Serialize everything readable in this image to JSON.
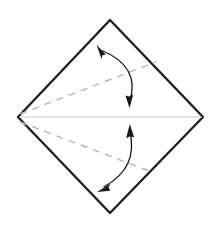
{
  "figure": {
    "title": "Origami fold step diagram",
    "background_color": "#ffffff"
  },
  "colors": {
    "paper_outline": "#231f20",
    "paper_fill": "#ffffff",
    "crease_dashed": "#b3b3b3",
    "center_line": "#cccccc",
    "arrow": "#1a1a1a"
  },
  "geometry": {
    "canvas": {
      "width": 221,
      "height": 229
    },
    "paper_shape": "diamond",
    "vertices": {
      "top": {
        "x": 110,
        "y": 20
      },
      "right": {
        "x": 203,
        "y": 117
      },
      "bottom": {
        "x": 110,
        "y": 213
      },
      "left": {
        "x": 18,
        "y": 117
      }
    },
    "outline_stroke_width": 2.4
  },
  "creases": [
    {
      "name": "upper-crease",
      "type": "dashed",
      "from": {
        "x": 20,
        "y": 114
      },
      "to": {
        "x": 156,
        "y": 62
      },
      "dash_pattern": "7 6",
      "stroke_width": 1.4
    },
    {
      "name": "lower-crease",
      "type": "dashed",
      "from": {
        "x": 20,
        "y": 122
      },
      "to": {
        "x": 152,
        "y": 172
      },
      "dash_pattern": "7 6",
      "stroke_width": 1.4
    }
  ],
  "center_line": {
    "name": "horizontal-center-line",
    "type": "solid-faint",
    "from": {
      "x": 19,
      "y": 117
    },
    "to": {
      "x": 202,
      "y": 117
    },
    "stroke_width": 1.2
  },
  "arrows": [
    {
      "name": "upper-fold-arrow",
      "kind": "curved-double-headed",
      "meaning": "fold upper flap down to center",
      "start": {
        "x": 99,
        "y": 48
      },
      "control": {
        "x": 141,
        "y": 66
      },
      "end": {
        "x": 130,
        "y": 105
      },
      "stroke_width": 1.3,
      "heads": [
        {
          "position": "start",
          "x": 99,
          "y": 48,
          "angle_deg": 248
        },
        {
          "position": "end",
          "x": 130,
          "y": 105,
          "angle_deg": 76
        }
      ]
    },
    {
      "name": "lower-fold-arrow",
      "kind": "curved-double-headed",
      "meaning": "fold lower flap up to center",
      "start": {
        "x": 130,
        "y": 127
      },
      "control": {
        "x": 138,
        "y": 166
      },
      "end": {
        "x": 101,
        "y": 190
      },
      "stroke_width": 1.3,
      "heads": [
        {
          "position": "start",
          "x": 130,
          "y": 127,
          "angle_deg": 282
        },
        {
          "position": "end",
          "x": 101,
          "y": 190,
          "angle_deg": 146
        }
      ]
    }
  ]
}
